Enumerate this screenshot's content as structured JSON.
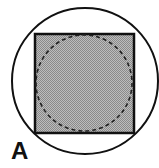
{
  "figure": {
    "label": "A",
    "colors": {
      "stroke": "#111111",
      "fill": "#a8a8a8",
      "background": "#ffffff"
    },
    "shapes": {
      "outer_circle": {
        "cx": 85,
        "cy": 81,
        "r": 74,
        "style": "solid"
      },
      "square": {
        "x": 35,
        "y": 34,
        "width": 99,
        "height": 99,
        "fill": "hatched-gray"
      },
      "inner_circle": {
        "cx": 84,
        "cy": 83,
        "r": 49,
        "style": "dashed"
      }
    }
  }
}
